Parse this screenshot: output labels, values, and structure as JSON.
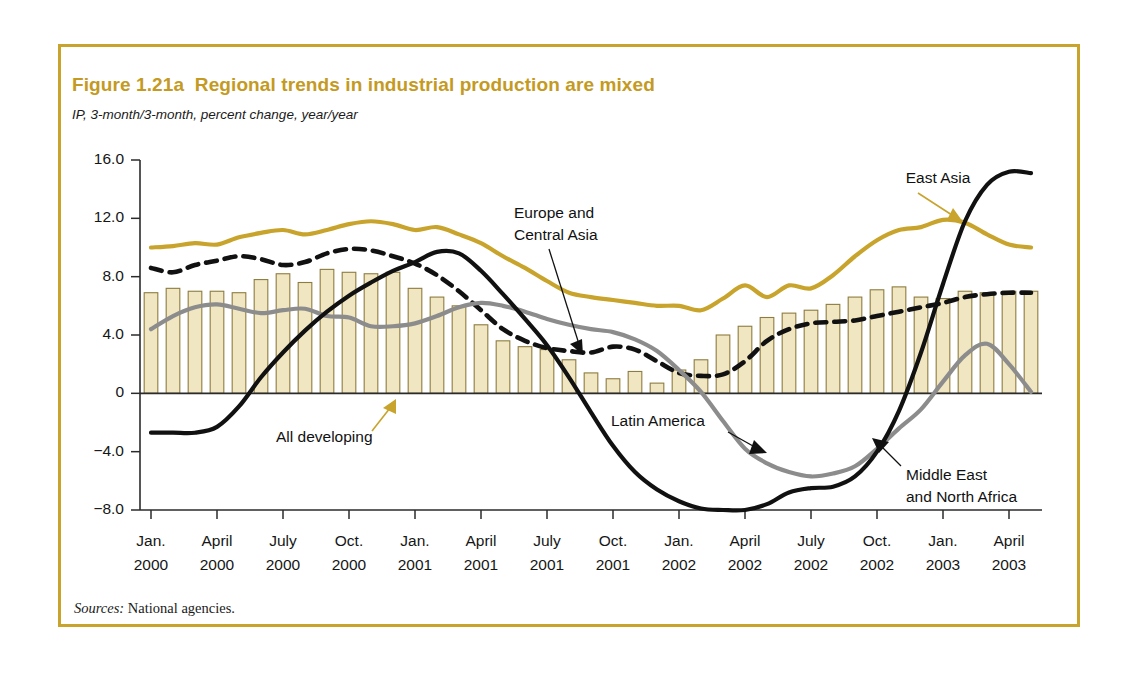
{
  "figure": {
    "title": "Figure 1.21a  Regional trends in industrial production are mixed",
    "subtitle": "IP, 3-month/3-month, percent change, year/year",
    "sources_label": "Sources:",
    "sources_text": " National agencies.",
    "frame_color": "#c8a42c",
    "title_color": "#c49a23"
  },
  "annotations": {
    "east_asia": "East Asia",
    "europe_central_asia_l1": "Europe and",
    "europe_central_asia_l2": "Central Asia",
    "all_developing": "All developing",
    "latin_america": "Latin America",
    "mena_l1": "Middle East",
    "mena_l2": "and North Africa"
  },
  "chart_data": {
    "type": "line",
    "title": "Figure 1.21a  Regional trends in industrial production are mixed",
    "subtitle": "IP, 3-month/3-month, percent change, year/year",
    "xlabel": "",
    "ylabel": "IP, 3-month/3-month, percent change, year/year",
    "ylim": [
      -8.0,
      16.0
    ],
    "yticks": [
      16.0,
      12.0,
      8.0,
      4.0,
      0,
      -4.0,
      -8.0
    ],
    "ytick_labels": [
      "16.0",
      "12.0",
      "8.0",
      "4.0",
      "0",
      "−4.0",
      "−8.0"
    ],
    "grid": false,
    "legend": "annotated-inline",
    "xtick_labels": [
      {
        "month": "Jan.",
        "year": "2000"
      },
      {
        "month": "April",
        "year": "2000"
      },
      {
        "month": "July",
        "year": "2000"
      },
      {
        "month": "Oct.",
        "year": "2000"
      },
      {
        "month": "Jan.",
        "year": "2001"
      },
      {
        "month": "April",
        "year": "2001"
      },
      {
        "month": "July",
        "year": "2001"
      },
      {
        "month": "Oct.",
        "year": "2001"
      },
      {
        "month": "Jan.",
        "year": "2002"
      },
      {
        "month": "April",
        "year": "2002"
      },
      {
        "month": "July",
        "year": "2002"
      },
      {
        "month": "Oct.",
        "year": "2002"
      },
      {
        "month": "Jan.",
        "year": "2003"
      },
      {
        "month": "April",
        "year": "2003"
      }
    ],
    "x_months": [
      "2000-01",
      "2000-02",
      "2000-03",
      "2000-04",
      "2000-05",
      "2000-06",
      "2000-07",
      "2000-08",
      "2000-09",
      "2000-10",
      "2000-11",
      "2000-12",
      "2001-01",
      "2001-02",
      "2001-03",
      "2001-04",
      "2001-05",
      "2001-06",
      "2001-07",
      "2001-08",
      "2001-09",
      "2001-10",
      "2001-11",
      "2001-12",
      "2002-01",
      "2002-02",
      "2002-03",
      "2002-04",
      "2002-05",
      "2002-06",
      "2002-07",
      "2002-08",
      "2002-09",
      "2002-10",
      "2002-11",
      "2002-12",
      "2003-01",
      "2003-02",
      "2003-03",
      "2003-04",
      "2003-05"
    ],
    "bars": {
      "name": "All developing",
      "color": "#f0e6c2",
      "edge_color": "#8d7c3f",
      "values": [
        6.9,
        7.2,
        7.0,
        7.0,
        6.9,
        7.8,
        8.2,
        7.6,
        8.5,
        8.3,
        8.2,
        8.3,
        7.2,
        6.6,
        6.0,
        4.7,
        3.6,
        3.2,
        3.0,
        2.3,
        1.4,
        1.0,
        1.5,
        0.7,
        1.6,
        2.3,
        4.0,
        4.6,
        5.2,
        5.5,
        5.7,
        6.1,
        6.6,
        7.1,
        7.3,
        6.6,
        6.5,
        7.0,
        6.9,
        7.0,
        7.0
      ]
    },
    "series": [
      {
        "name": "East Asia",
        "color": "#c8a42c",
        "style": "solid",
        "values": [
          10.0,
          10.1,
          10.3,
          10.2,
          10.7,
          11.0,
          11.2,
          10.9,
          11.2,
          11.6,
          11.8,
          11.6,
          11.2,
          11.4,
          10.9,
          10.3,
          9.4,
          8.6,
          7.7,
          6.9,
          6.6,
          6.4,
          6.2,
          6.0,
          6.0,
          5.7,
          6.5,
          7.4,
          6.6,
          7.4,
          7.2,
          8.1,
          9.4,
          10.5,
          11.2,
          11.4,
          11.9,
          11.7,
          10.9,
          10.2,
          10.0
        ]
      },
      {
        "name": "Europe and Central Asia",
        "color": "#111111",
        "style": "dashed",
        "values": [
          8.6,
          8.3,
          8.8,
          9.1,
          9.4,
          9.2,
          8.8,
          9.0,
          9.6,
          9.9,
          9.8,
          9.4,
          8.9,
          8.1,
          7.0,
          5.7,
          4.4,
          3.6,
          3.1,
          2.9,
          2.8,
          3.2,
          3.0,
          2.2,
          1.4,
          1.2,
          1.3,
          2.2,
          3.6,
          4.4,
          4.8,
          4.9,
          5.0,
          5.3,
          5.6,
          5.9,
          6.2,
          6.6,
          6.8,
          6.9,
          6.9
        ]
      },
      {
        "name": "Latin America",
        "color": "#8c8c8c",
        "style": "solid",
        "values": [
          4.4,
          5.3,
          5.9,
          6.1,
          5.8,
          5.5,
          5.7,
          5.8,
          5.3,
          5.2,
          4.6,
          4.6,
          4.8,
          5.3,
          5.9,
          6.2,
          6.0,
          5.6,
          5.1,
          4.7,
          4.4,
          4.2,
          3.7,
          2.9,
          1.6,
          0.1,
          -1.9,
          -3.8,
          -4.8,
          -5.4,
          -5.7,
          -5.5,
          -5.0,
          -3.8,
          -2.4,
          -1.1,
          0.8,
          2.6,
          3.4,
          2.0,
          0.1
        ]
      },
      {
        "name": "Middle East and North Africa",
        "color": "#111111",
        "style": "solid",
        "values": [
          -2.7,
          -2.7,
          -2.7,
          -2.3,
          -0.9,
          1.1,
          2.8,
          4.3,
          5.6,
          6.7,
          7.6,
          8.4,
          9.0,
          9.7,
          9.6,
          8.4,
          6.8,
          5.1,
          3.3,
          1.1,
          -1.3,
          -3.6,
          -5.4,
          -6.6,
          -7.4,
          -7.9,
          -8.0,
          -8.0,
          -7.6,
          -6.8,
          -6.5,
          -6.4,
          -5.7,
          -4.0,
          -1.2,
          2.8,
          7.5,
          11.8,
          14.3,
          15.2,
          15.1
        ]
      }
    ]
  }
}
